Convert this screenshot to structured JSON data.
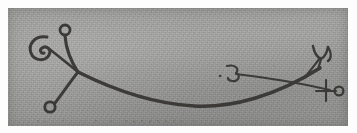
{
  "figure": {
    "kind": "scanned-hand-drawn-line-drawing",
    "caption": "",
    "plate": {
      "background_color": "#9e9e9c",
      "page_color": "#fdfdfd",
      "ink_color": "#3c3a38",
      "left": 8,
      "top": 8,
      "width": 340,
      "height": 118
    },
    "strokes": {
      "main_curve": {
        "name": "long-sagging-curve",
        "path": "M 70 64 C 110 84, 150 96, 186 98 C 224 100, 268 88, 312 60",
        "width": 3.6
      },
      "upper_left_branch": {
        "name": "branch-to-top-circle",
        "path": "M 70 64 C 62 52, 58 40, 57 28",
        "width": 3.1
      },
      "lower_left_branch": {
        "name": "branch-to-lower-left-circle",
        "path": "M 70 64 C 62 74, 54 86, 47 95",
        "width": 2.9
      },
      "curl_connector": {
        "name": "branch-to-left-curl",
        "path": "M 70 64 C 60 56, 48 46, 40 40",
        "width": 2.6
      },
      "right_crossbar": {
        "name": "right-horizontal-crossbar",
        "path": "M 228 66 C 262 70, 292 75, 322 82",
        "width": 2.2
      },
      "right_upper_stem": {
        "name": "stem-to-trident",
        "path": "M 296 70 C 303 62, 308 55, 312 50",
        "width": 2.2
      }
    },
    "glyphs": [
      {
        "name": "top-circle",
        "shape": "circle",
        "cx": 57,
        "cy": 22,
        "r": 5.0
      },
      {
        "name": "lower-left-circle",
        "shape": "circle",
        "cx": 42,
        "cy": 99,
        "r": 5.2
      },
      {
        "name": "left-curl",
        "shape": "open-c-with-inner-curl",
        "cx": 30,
        "cy": 40
      },
      {
        "name": "hook-glyph",
        "shape": "three-like-hook",
        "cx": 226,
        "cy": 64
      },
      {
        "name": "trident-fork",
        "shape": "y-fork",
        "cx": 312,
        "cy": 46
      },
      {
        "name": "cross-and-circle",
        "shape": "plus-with-small-circle",
        "cx": 323,
        "cy": 82
      }
    ],
    "speckles": {
      "name": "bottom-edge-speckle-row",
      "count": 16,
      "y": 113,
      "xs": [
        30,
        37,
        55,
        88,
        103,
        118,
        126,
        134,
        142,
        150,
        158,
        166,
        173,
        186,
        212,
        248
      ]
    }
  }
}
